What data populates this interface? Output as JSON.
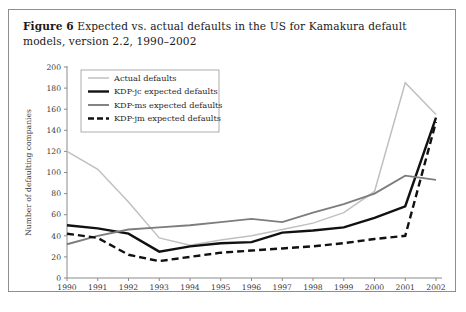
{
  "caption": {
    "figure_label": "Figure 6",
    "text": "Expected vs. actual defaults in the US for Kamakura default models, version 2.2, 1990–2002"
  },
  "chart_data": {
    "type": "line",
    "title": "Expected vs. actual defaults in the US for Kamakura default models, version 2.2, 1990–2002",
    "xlabel": "",
    "ylabel": "Number of defaulting companies",
    "categories": [
      "1990",
      "1991",
      "1992",
      "1993",
      "1994",
      "1995",
      "1996",
      "1997",
      "1998",
      "1999",
      "2000",
      "2001",
      "2002"
    ],
    "x": [
      1990,
      1991,
      1992,
      1993,
      1994,
      1995,
      1996,
      1997,
      1998,
      1999,
      2000,
      2001,
      2002
    ],
    "xlim": [
      1990,
      2002
    ],
    "ylim": [
      0,
      200
    ],
    "yticks": [
      0,
      20,
      40,
      60,
      80,
      100,
      120,
      140,
      160,
      180,
      200
    ],
    "ytick_labels": [
      "0",
      "20",
      "40",
      "60",
      "80",
      "100",
      "120",
      "140",
      "160",
      "180",
      "200"
    ],
    "grid": false,
    "legend_position": "upper left",
    "series": [
      {
        "name": "Actual defaults",
        "color": "#c0c0c0",
        "width": 1.5,
        "dash": "none",
        "values": [
          120,
          103,
          72,
          38,
          31,
          36,
          40,
          46,
          52,
          62,
          82,
          185,
          155
        ]
      },
      {
        "name": "KDP-jc expected defaults",
        "color": "#111111",
        "width": 2.4,
        "dash": "none",
        "values": [
          50,
          47,
          42,
          25,
          30,
          33,
          34,
          43,
          45,
          48,
          57,
          68,
          152
        ]
      },
      {
        "name": "KDP-ms expected defaults",
        "color": "#7d7d7d",
        "width": 1.9,
        "dash": "none",
        "values": [
          32,
          40,
          46,
          48,
          50,
          53,
          56,
          53,
          62,
          70,
          80,
          97,
          93
        ]
      },
      {
        "name": "KDP-jm expected defaults",
        "color": "#111111",
        "width": 2.4,
        "dash": "7,4",
        "values": [
          42,
          38,
          22,
          16,
          20,
          24,
          26,
          28,
          30,
          33,
          37,
          40,
          148
        ]
      }
    ]
  }
}
